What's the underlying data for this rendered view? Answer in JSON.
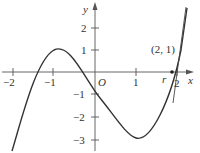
{
  "figure": {
    "function": "y = x^3 - 3x - 1",
    "axes": {
      "x_label": "x",
      "y_label": "y",
      "origin_label": "O",
      "x_ticks": [
        {
          "value": -2,
          "label": "−2"
        },
        {
          "value": -1,
          "label": "−1"
        },
        {
          "value": 1,
          "label": "1"
        },
        {
          "value": 2,
          "label": "2"
        }
      ],
      "y_ticks": [
        {
          "value": 2,
          "label": "2"
        },
        {
          "value": 1,
          "label": "1"
        },
        {
          "value": -1,
          "label": "−1"
        },
        {
          "value": -2,
          "label": "−2"
        },
        {
          "value": -3,
          "label": "−3"
        }
      ]
    },
    "annotations": {
      "point_label": "(2, 1)",
      "root_label": "r"
    },
    "tangent_line": {
      "through_point": [
        2,
        1
      ],
      "slope": 9,
      "x_intercept": 1.89
    },
    "colors": {
      "curve": "#333333",
      "axis": "#555555",
      "text": "#333333"
    }
  }
}
